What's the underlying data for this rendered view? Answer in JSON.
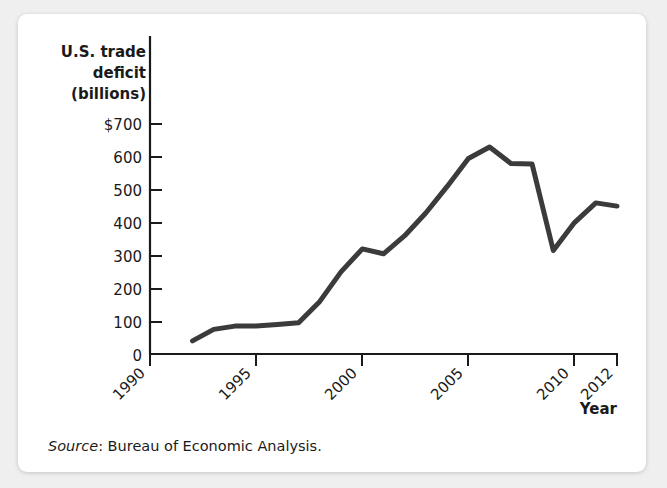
{
  "figure": {
    "source_prefix": "Source",
    "source_text": ": Bureau of Economic Analysis."
  },
  "chart_data": {
    "type": "line",
    "title": "",
    "ylabel_lines": [
      "U.S. trade",
      "deficit",
      "(billions)"
    ],
    "xlabel": "Year",
    "ylabel": "U.S. trade deficit (billions)",
    "ytick_labels": [
      "$700",
      "600",
      "500",
      "400",
      "300",
      "200",
      "100",
      "0"
    ],
    "ytick_values": [
      700,
      600,
      500,
      400,
      300,
      200,
      100,
      0
    ],
    "xtick_labels": [
      "1990",
      "1995",
      "2000",
      "2005",
      "2010",
      "2012"
    ],
    "xtick_values": [
      1990,
      1995,
      2000,
      2005,
      2010,
      2012
    ],
    "xlim": [
      1990,
      2012
    ],
    "ylim": [
      0,
      740
    ],
    "grid": false,
    "legend": false,
    "line_color": "#3b3b3b",
    "x": [
      1992,
      1993,
      1994,
      1995,
      1996,
      1997,
      1998,
      1999,
      2000,
      2001,
      2002,
      2003,
      2004,
      2005,
      2006,
      2007,
      2008,
      2009,
      2010,
      2011,
      2012
    ],
    "values": [
      39,
      70,
      98,
      96,
      104,
      108,
      166,
      258,
      372,
      361,
      418,
      494,
      607,
      711,
      753,
      697,
      698,
      381,
      494,
      549,
      537
    ],
    "series": [
      {
        "name": "U.S. trade deficit",
        "values": [
          39,
          70,
          98,
          96,
          104,
          108,
          166,
          258,
          372,
          361,
          418,
          494,
          607,
          711,
          753,
          697,
          698,
          381,
          494,
          549,
          537
        ]
      }
    ],
    "read_values": [
      40,
      75,
      85,
      85,
      90,
      95,
      160,
      250,
      320,
      305,
      360,
      430,
      510,
      595,
      630,
      580,
      578,
      315,
      400,
      460,
      450
    ]
  }
}
